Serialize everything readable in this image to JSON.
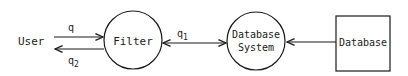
{
  "diagram": {
    "nodes": [
      {
        "id": "user",
        "label": "User",
        "shape": "text"
      },
      {
        "id": "filter",
        "label": "Filter",
        "shape": "circle"
      },
      {
        "id": "dbsystem",
        "label_line1": "Database",
        "label_line2": "System",
        "shape": "circle"
      },
      {
        "id": "database",
        "label": "Database",
        "shape": "rectangle"
      }
    ],
    "edges": [
      {
        "from": "user",
        "to": "filter",
        "label": "q"
      },
      {
        "from": "filter",
        "to": "user",
        "label": "q",
        "subscript": "2"
      },
      {
        "from": "filter",
        "to": "dbsystem",
        "label": "q",
        "subscript": "1",
        "bidirectional": true
      },
      {
        "from": "database",
        "to": "dbsystem",
        "label": ""
      }
    ],
    "colors": {
      "stroke": "#1a1a1a",
      "background": "#ffffff"
    }
  }
}
